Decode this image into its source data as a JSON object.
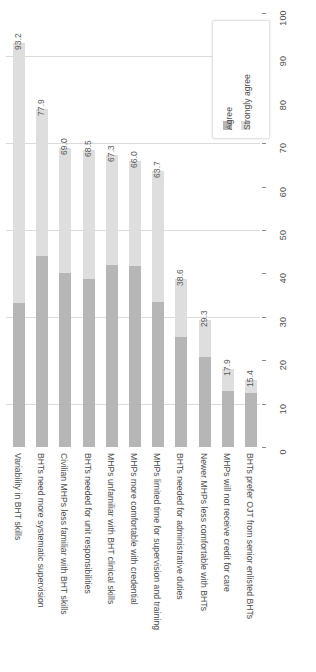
{
  "chart_data": {
    "type": "bar",
    "subtype": "stacked-bar",
    "orientation": "vertical-bars-rotated-labels",
    "title": "",
    "subtitle": "",
    "xlabel": "",
    "ylabel": "",
    "ylim": [
      0,
      100
    ],
    "ytick_step": 10,
    "grid": true,
    "gridlines_at": [
      10,
      30,
      50,
      70,
      90
    ],
    "legend_position": "top-right",
    "categories": [
      "Variability in BHT skills",
      "BHTs need more systematic supervision",
      "Civilian MHPs less familiar with BHT skills",
      "BHTs needed for unit responsibilities",
      "MHPs unfamiliar with BHT clinical skills",
      "MHPs more comfortable with credential",
      "MHPs limited time for supervision and training",
      "BHTs needed for administrative duties",
      "Newer MHPs less comfortable with BHTs",
      "MHPs will not receive credit for care",
      "BHTs prefer OJT from senior enlisted BHTs"
    ],
    "series": [
      {
        "name": "Agree",
        "color": "#b6b6b6",
        "values": [
          33.2,
          44.0,
          40.2,
          38.8,
          42.0,
          41.6,
          33.5,
          25.3,
          20.8,
          12.9,
          12.4
        ]
      },
      {
        "name": "Strongly agree",
        "color": "#dedede",
        "values": [
          60.0,
          33.9,
          28.8,
          29.7,
          25.3,
          24.4,
          30.2,
          13.3,
          8.5,
          5.0,
          3.0
        ]
      }
    ],
    "totals": [
      93.2,
      77.9,
      69.0,
      68.5,
      67.3,
      66.0,
      63.7,
      38.6,
      29.3,
      17.9,
      15.4
    ],
    "total_labels": [
      "93.2",
      "77.9",
      "69.0",
      "68.5",
      "67.3",
      "66.0",
      "63.7",
      "38.6",
      "29.3",
      "17.9",
      "15.4"
    ],
    "ytick_labels": [
      "0",
      "10",
      "20",
      "30",
      "40",
      "50",
      "60",
      "70",
      "80",
      "90",
      "100"
    ],
    "ytick_values": [
      0,
      10,
      20,
      30,
      40,
      50,
      60,
      70,
      80,
      90,
      100
    ]
  },
  "legend": {
    "entries": [
      {
        "label": "Agree",
        "color": "#b6b6b6"
      },
      {
        "label": "Strongly agree",
        "color": "#dedede"
      }
    ]
  }
}
